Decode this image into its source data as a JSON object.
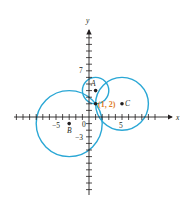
{
  "diagram": {
    "axes": {
      "x_label": "x",
      "y_label": "y",
      "origin_px": [
        89,
        117
      ],
      "unit_px": 6.6,
      "x_range": [
        -11,
        10
      ],
      "y_range": [
        -11,
        12
      ],
      "tick_labels": {
        "x_neg5": "−5",
        "x_5": "5",
        "y_7": "7",
        "y_neg3": "−3",
        "origin": "0"
      }
    },
    "points": [
      {
        "id": "A",
        "label": "A",
        "x": 1,
        "y": 4
      },
      {
        "id": "B",
        "label": "B",
        "x": -3,
        "y": -1
      },
      {
        "id": "C",
        "label": "C",
        "x": 5,
        "y": 2
      },
      {
        "id": "P",
        "label": "(1, 2)",
        "x": 1,
        "y": 2
      }
    ],
    "circles": [
      {
        "center": "A",
        "radius": 2
      },
      {
        "center": "B",
        "radius": 5
      },
      {
        "center": "C",
        "radius": 4
      }
    ],
    "colors": {
      "circle": "#2aa7d5",
      "axis": "#231f20",
      "highlight_label": "#e07b26"
    }
  }
}
